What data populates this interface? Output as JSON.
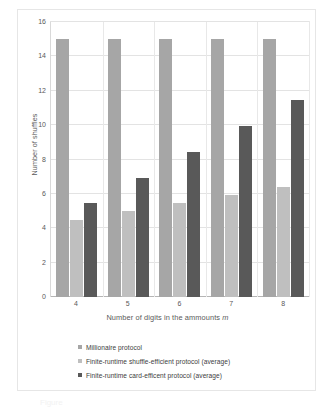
{
  "chart_data": {
    "type": "bar",
    "title": "",
    "xlabel": "Number of digits in the ammounts m",
    "xlabel_plain": "Number of digits in the ammounts ",
    "xlabel_variable": "m",
    "ylabel": "Number of shuffles",
    "categories": [
      "4",
      "5",
      "6",
      "7",
      "8"
    ],
    "ylim": [
      0,
      16
    ],
    "yticks": [
      "0",
      "2",
      "4",
      "6",
      "8",
      "10",
      "12",
      "14",
      "16"
    ],
    "ytick_values": [
      0,
      2,
      4,
      6,
      8,
      10,
      12,
      14,
      16
    ],
    "grid": true,
    "legend_position": "bottom",
    "series": [
      {
        "name": "Millionaire protocol",
        "color": "#a6a6a6",
        "values": [
          15,
          15,
          15,
          15,
          15
        ]
      },
      {
        "name": "Finite-runtime shuffle-efficient protocol (average)",
        "color": "#bfbfbf",
        "values": [
          4.5,
          5.0,
          5.45,
          5.95,
          6.4
        ]
      },
      {
        "name": "Finite-runtime card-efficent protocol (average)",
        "color": "#595959",
        "values": [
          5.45,
          6.95,
          8.45,
          9.95,
          11.45
        ]
      }
    ]
  },
  "caption": {
    "remnant": "Figure"
  }
}
